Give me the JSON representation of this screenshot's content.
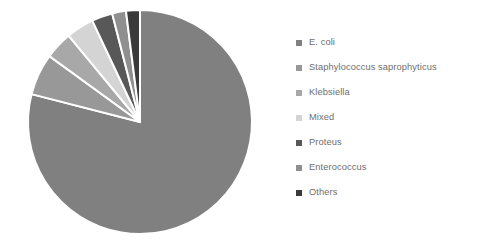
{
  "figure": {
    "background_color": "#ffffff",
    "legend_text_color": "#6e6e6e"
  },
  "legend": {
    "position": "right",
    "items": [
      {
        "label": "E. coli",
        "color": "#808080"
      },
      {
        "label": "Staphylococcus saprophyticus",
        "color": "#989898"
      },
      {
        "label": "Klebsiella",
        "color": "#a8a8a8"
      },
      {
        "label": "Mixed",
        "color": "#d4d4d4"
      },
      {
        "label": "Proteus",
        "color": "#585858"
      },
      {
        "label": "Enterococcus",
        "color": "#8f8f8f"
      },
      {
        "label": "Others",
        "color": "#3a3a3a"
      }
    ]
  },
  "chart_data": {
    "type": "pie",
    "title": "",
    "subtitle": "",
    "xlabel": "",
    "ylabel": "",
    "grid": false,
    "legend_position": "right",
    "start_angle_deg": 0,
    "direction": "clockwise",
    "separator_color": "#ffffff",
    "separator_width_px": 2,
    "center": {
      "x": 140,
      "y": 122
    },
    "radius": 112,
    "categories": [
      "E. coli",
      "Staphylococcus saprophyticus",
      "Klebsiella",
      "Mixed",
      "Proteus",
      "Enterococcus",
      "Others"
    ],
    "values": [
      79,
      6,
      4,
      4,
      3,
      2,
      2
    ],
    "value_unit": "percent",
    "colors": [
      "#808080",
      "#989898",
      "#a8a8a8",
      "#d4d4d4",
      "#585858",
      "#8f8f8f",
      "#3a3a3a"
    ],
    "slices": [
      {
        "label": "E. coli",
        "value": 79,
        "angle_deg": 284.4,
        "color": "#808080"
      },
      {
        "label": "Staphylococcus saprophyticus",
        "value": 6,
        "angle_deg": 21.6,
        "color": "#989898"
      },
      {
        "label": "Klebsiella",
        "value": 4,
        "angle_deg": 14.4,
        "color": "#a8a8a8"
      },
      {
        "label": "Mixed",
        "value": 4,
        "angle_deg": 14.4,
        "color": "#d4d4d4"
      },
      {
        "label": "Proteus",
        "value": 3,
        "angle_deg": 10.8,
        "color": "#585858"
      },
      {
        "label": "Enterococcus",
        "value": 2,
        "angle_deg": 7.2,
        "color": "#8f8f8f"
      },
      {
        "label": "Others",
        "value": 2,
        "angle_deg": 7.2,
        "color": "#3a3a3a"
      }
    ]
  }
}
